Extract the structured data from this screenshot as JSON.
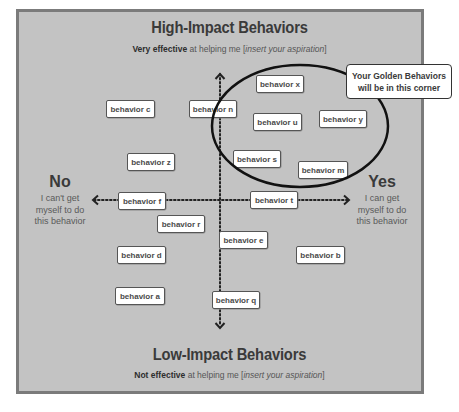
{
  "diagram": {
    "top": {
      "title": "High-Impact Behaviors",
      "subtitle_bold": "Very effective",
      "subtitle_mid": " at helping me [",
      "subtitle_italic": "insert your aspiration",
      "subtitle_end": "]"
    },
    "bottom": {
      "title": "Low-Impact Behaviors",
      "subtitle_bold": "Not effective",
      "subtitle_mid": " at helping me [",
      "subtitle_italic": "insert your aspiration",
      "subtitle_end": "]"
    },
    "left": {
      "heading": "No",
      "line1": "I can't get",
      "line2": "myself to do",
      "line3": "this behavior"
    },
    "right": {
      "heading": "Yes",
      "line1": "I can get",
      "line2": "myself to do",
      "line3": "this behavior"
    },
    "callout": {
      "line1": "Your Golden Behaviors",
      "line2": "will be in this corner"
    },
    "behaviors": [
      {
        "label": "behavior x",
        "x": 256,
        "y": 75,
        "w": 46
      },
      {
        "label": "behavior c",
        "x": 106,
        "y": 100,
        "w": 47
      },
      {
        "label": "behavior n",
        "x": 189,
        "y": 100,
        "w": 46
      },
      {
        "label": "behavior u",
        "x": 253,
        "y": 113,
        "w": 47
      },
      {
        "label": "behavior y",
        "x": 319,
        "y": 110,
        "w": 46
      },
      {
        "label": "behavior z",
        "x": 127,
        "y": 153,
        "w": 46
      },
      {
        "label": "behavior s",
        "x": 233,
        "y": 150,
        "w": 46
      },
      {
        "label": "behavior m",
        "x": 298,
        "y": 161,
        "w": 48
      },
      {
        "label": "behavior f",
        "x": 118,
        "y": 192,
        "w": 46
      },
      {
        "label": "behavior t",
        "x": 250,
        "y": 191,
        "w": 46
      },
      {
        "label": "behavior r",
        "x": 157,
        "y": 215,
        "w": 46
      },
      {
        "label": "behavior e",
        "x": 219,
        "y": 231,
        "w": 47
      },
      {
        "label": "behavior d",
        "x": 117,
        "y": 246,
        "w": 47
      },
      {
        "label": "behavior b",
        "x": 296,
        "y": 246,
        "w": 47
      },
      {
        "label": "behavior a",
        "x": 115,
        "y": 287,
        "w": 48
      },
      {
        "label": "behavior q",
        "x": 212,
        "y": 291,
        "w": 46
      }
    ],
    "colors": {
      "background": "#c3c3c3",
      "border": "#7b7b7b",
      "text_dark": "#3a3a3a",
      "box_fill": "#ffffff"
    }
  }
}
